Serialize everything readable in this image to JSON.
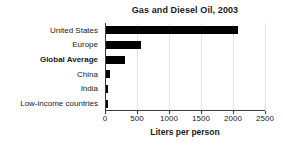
{
  "chart_data": {
    "type": "bar",
    "orientation": "horizontal",
    "title": "Gas and Diesel Oil, 2003",
    "xlabel": "Liters per person",
    "ylabel": "",
    "categories": [
      "United States",
      "Europe",
      "Global Average",
      "China",
      "India",
      "Low-income countries"
    ],
    "values": [
      2060,
      550,
      300,
      65,
      30,
      25
    ],
    "emphasized_categories": [
      "Global Average"
    ],
    "xlim": [
      0,
      2500
    ],
    "xticks": [
      0,
      500,
      1000,
      1500,
      2000,
      2500
    ],
    "xtick_labels": [
      "0",
      "500",
      "1000",
      "1500",
      "2000",
      "2500"
    ],
    "grid": true,
    "grid_axis": "x",
    "legend": false,
    "bar_color": "#000000",
    "grid_color": "#e4e4e4",
    "axis_color": "#3a3a3a",
    "background_color": "#ffffff"
  }
}
